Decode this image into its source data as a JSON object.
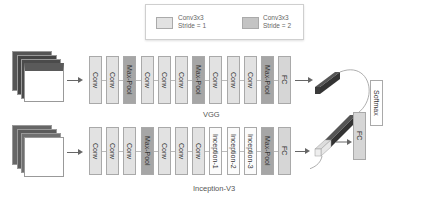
{
  "legend": {
    "items": [
      {
        "label_line1": "Conv3x3",
        "label_line2": "Stride = 1",
        "color": "#e2e2e2"
      },
      {
        "label_line1": "Conv3x3",
        "label_line2": "Stride = 2",
        "color": "#a6a6a6"
      }
    ]
  },
  "vgg": {
    "caption": "VGG",
    "blocks": [
      {
        "label": "Conv",
        "type": "conv"
      },
      {
        "label": "Conv",
        "type": "conv"
      },
      {
        "label": "Max-Pool",
        "type": "pool"
      },
      {
        "label": "Conv",
        "type": "conv"
      },
      {
        "label": "Conv",
        "type": "conv"
      },
      {
        "label": "Conv",
        "type": "conv"
      },
      {
        "label": "Max-Pool",
        "type": "pool"
      },
      {
        "label": "Conv",
        "type": "conv"
      },
      {
        "label": "Conv",
        "type": "conv"
      },
      {
        "label": "Conv",
        "type": "conv"
      },
      {
        "label": "Max-Pool",
        "type": "pool"
      },
      {
        "label": "FC",
        "type": "fc"
      }
    ]
  },
  "inception": {
    "caption": "Inception-V3",
    "blocks": [
      {
        "label": "Conv",
        "type": "conv"
      },
      {
        "label": "Conv",
        "type": "conv"
      },
      {
        "label": "Conv",
        "type": "conv"
      },
      {
        "label": "Max-Pool",
        "type": "pool"
      },
      {
        "label": "Conv",
        "type": "conv"
      },
      {
        "label": "Conv",
        "type": "conv"
      },
      {
        "label": "Conv",
        "type": "conv"
      },
      {
        "label": "Inception-1",
        "type": "incep"
      },
      {
        "label": "Inception-2",
        "type": "incep"
      },
      {
        "label": "Inception-3",
        "type": "incep"
      },
      {
        "label": "Max-Pool",
        "type": "pool"
      },
      {
        "label": "FC",
        "type": "fc"
      }
    ]
  },
  "head": {
    "fc_label": "FC",
    "softmax_label": "Softmax"
  }
}
